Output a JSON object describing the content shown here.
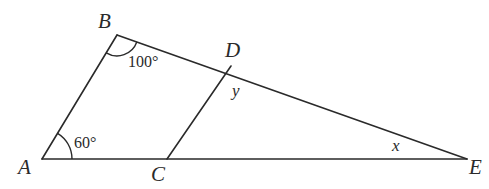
{
  "figure": {
    "type": "geometry",
    "points": {
      "A": {
        "label": "A",
        "x": 42,
        "y": 159
      },
      "B": {
        "label": "B",
        "x": 117,
        "y": 35
      },
      "C": {
        "label": "C",
        "x": 167,
        "y": 159
      },
      "D": {
        "label": "D",
        "x": 231,
        "y": 66
      },
      "E": {
        "label": "E",
        "x": 467,
        "y": 159
      }
    },
    "segments": [
      "AB",
      "BE",
      "AE",
      "CD"
    ],
    "angles": {
      "A": {
        "label": "60°",
        "vertex": "A"
      },
      "B": {
        "label": "100°",
        "vertex": "B"
      },
      "D": {
        "label": "y",
        "vertex": "D",
        "note": "angle CDE"
      },
      "E": {
        "label": "x",
        "vertex": "E"
      }
    },
    "stroke_color": "#2a2a2a",
    "background": "#ffffff"
  }
}
